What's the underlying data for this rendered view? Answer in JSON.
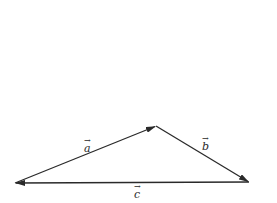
{
  "diagram": {
    "type": "vector-triangle",
    "stroke_color": "#2a2a2a",
    "vertices": {
      "left": [
        15,
        183
      ],
      "top": [
        156,
        126
      ],
      "right": [
        249,
        182
      ]
    },
    "vectors": [
      {
        "name": "a",
        "label": "a",
        "from": "left",
        "to": "top",
        "label_pos": [
          84,
          140
        ]
      },
      {
        "name": "b",
        "label": "b",
        "from": "top",
        "to": "right",
        "label_pos": [
          202,
          139
        ]
      },
      {
        "name": "c",
        "label": "c",
        "from": "right",
        "to": "left",
        "label_pos": [
          134,
          186
        ]
      }
    ],
    "arrow_glyph": "→"
  }
}
